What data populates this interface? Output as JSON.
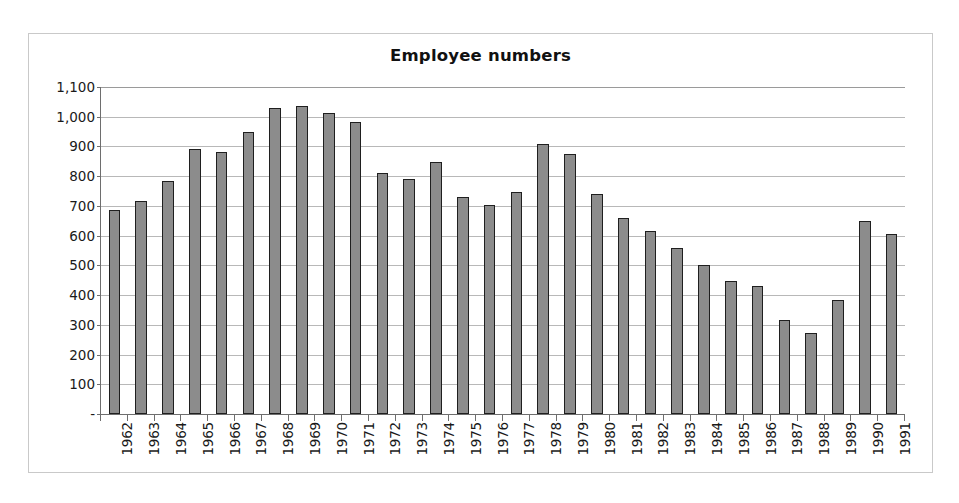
{
  "chart_data": {
    "type": "bar",
    "title": "Employee numbers",
    "xlabel": "",
    "ylabel": "",
    "ylim": [
      0,
      1100
    ],
    "ytick_step": 100,
    "grid": "horizontal",
    "legend": "none",
    "zero_tick_label": "-",
    "categories": [
      "1962",
      "1963",
      "1964",
      "1965",
      "1966",
      "1967",
      "1968",
      "1969",
      "1970",
      "1971",
      "1972",
      "1973",
      "1974",
      "1975",
      "1976",
      "1977",
      "1978",
      "1979",
      "1980",
      "1981",
      "1982",
      "1983",
      "1984",
      "1985",
      "1986",
      "1987",
      "1988",
      "1989",
      "1990",
      "1991"
    ],
    "values": [
      685,
      715,
      785,
      890,
      882,
      950,
      1028,
      1035,
      1012,
      982,
      812,
      790,
      848,
      730,
      702,
      748,
      908,
      875,
      740,
      658,
      615,
      560,
      500,
      447,
      432,
      315,
      273,
      385,
      650,
      605
    ],
    "ytick_labels": [
      "1,100",
      "1,000",
      "900",
      "800",
      "700",
      "600",
      "500",
      "400",
      "300",
      "200",
      "100",
      "-"
    ],
    "ytick_values": [
      1100,
      1000,
      900,
      800,
      700,
      600,
      500,
      400,
      300,
      200,
      100,
      0
    ],
    "colors": {
      "bar_fill": "#8c8c8c",
      "bar_outline": "#1f1f1f",
      "gridline": "#b8b8b8",
      "axis": "#6e6e6e",
      "border": "#c9c9c9",
      "text": "#1a1a1a"
    }
  }
}
